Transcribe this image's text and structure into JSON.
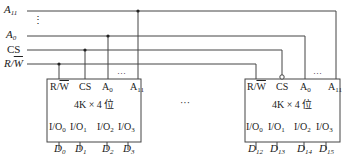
{
  "signals": {
    "a11": {
      "name": "A",
      "sub": "11"
    },
    "vdots": "⋮",
    "a0": {
      "name": "A",
      "sub": "0"
    },
    "cs": "CS",
    "rw": {
      "r": "R/",
      "w": "W"
    }
  },
  "chips": [
    {
      "pins_top": {
        "rw_r": "R/",
        "rw_w": "W",
        "cs": "CS",
        "a0": "A",
        "a0_sub": "0",
        "dots": "···",
        "a11": "A",
        "a11_sub": "11"
      },
      "title": "4K × 4 位",
      "io": [
        {
          "n": "I/O",
          "s": "0"
        },
        {
          "n": "I/O",
          "s": "1"
        },
        {
          "n": "I/O",
          "s": "2"
        },
        {
          "n": "I/O",
          "s": "3"
        }
      ],
      "data": [
        {
          "n": "D",
          "s": "0"
        },
        {
          "n": "D",
          "s": "1"
        },
        {
          "n": "D",
          "s": "2"
        },
        {
          "n": "D",
          "s": "3"
        }
      ]
    },
    {
      "pins_top": {
        "rw_r": "R/",
        "rw_w": "W",
        "cs": "CS",
        "a0": "A",
        "a0_sub": "0",
        "dots": "···",
        "a11": "A",
        "a11_sub": "11"
      },
      "title": "4K × 4 位",
      "io": [
        {
          "n": "I/O",
          "s": "0"
        },
        {
          "n": "I/O",
          "s": "1"
        },
        {
          "n": "I/O",
          "s": "2"
        },
        {
          "n": "I/O",
          "s": "3"
        }
      ],
      "data": [
        {
          "n": "D",
          "s": "12"
        },
        {
          "n": "D",
          "s": "13"
        },
        {
          "n": "D",
          "s": "14"
        },
        {
          "n": "D",
          "s": "15"
        }
      ]
    }
  ],
  "middle_ellipsis": "···"
}
